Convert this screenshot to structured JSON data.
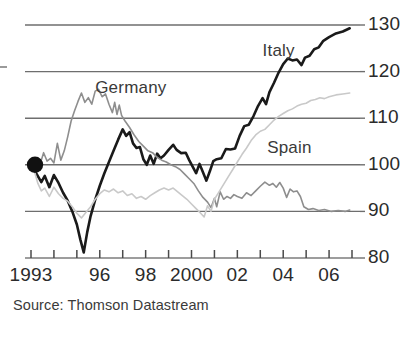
{
  "chart_data": {
    "type": "line",
    "title": "",
    "subtitle": "",
    "xlabel": "",
    "ylabel": "",
    "xlim": [
      1993,
      2007
    ],
    "ylim": [
      80,
      130
    ],
    "grid": true,
    "gridlines_y": [
      80,
      90,
      100,
      110,
      120,
      130
    ],
    "legend_position": "inline-annotations",
    "index_base_note": "Index, 1993 = 100",
    "y_tick_labels": [
      "130",
      "120",
      "110",
      "100",
      "90",
      "80"
    ],
    "y_ticks": [
      130,
      120,
      110,
      100,
      90,
      80
    ],
    "x_tick_years": [
      1993,
      1994,
      1995,
      1996,
      1997,
      1998,
      1999,
      2000,
      2001,
      2002,
      2003,
      2004,
      2005,
      2006,
      2007
    ],
    "x_tick_labels": [
      "1993",
      "",
      "",
      "96",
      "",
      "98",
      "",
      "2000",
      "",
      "02",
      "",
      "04",
      "",
      "06",
      ""
    ],
    "start_marker": {
      "x": 1993.0,
      "y": 100,
      "shape": "filled-circle",
      "color": "#111111"
    },
    "series": [
      {
        "name": "Italy",
        "color": "#1a1a1a",
        "width": 2.6,
        "label_position": {
          "x": 2003.1,
          "y": 124.5
        },
        "points": [
          [
            1993.0,
            100.0
          ],
          [
            1993.25,
            98.0
          ],
          [
            1993.45,
            96.3
          ],
          [
            1993.6,
            97.6
          ],
          [
            1993.8,
            95.2
          ],
          [
            1994.0,
            97.8
          ],
          [
            1994.2,
            96.1
          ],
          [
            1994.4,
            94.0
          ],
          [
            1994.6,
            92.3
          ],
          [
            1994.8,
            90.0
          ],
          [
            1995.0,
            87.2
          ],
          [
            1995.15,
            84.0
          ],
          [
            1995.3,
            81.2
          ],
          [
            1995.45,
            85.5
          ],
          [
            1995.6,
            89.0
          ],
          [
            1995.8,
            92.5
          ],
          [
            1996.0,
            95.5
          ],
          [
            1996.2,
            98.2
          ],
          [
            1996.4,
            100.6
          ],
          [
            1996.6,
            103.0
          ],
          [
            1996.8,
            105.4
          ],
          [
            1997.0,
            107.6
          ],
          [
            1997.15,
            106.2
          ],
          [
            1997.3,
            107.0
          ],
          [
            1997.45,
            104.6
          ],
          [
            1997.6,
            103.6
          ],
          [
            1997.75,
            103.8
          ],
          [
            1997.9,
            101.2
          ],
          [
            1998.05,
            100.0
          ],
          [
            1998.2,
            102.0
          ],
          [
            1998.35,
            100.2
          ],
          [
            1998.5,
            102.4
          ],
          [
            1998.65,
            101.4
          ],
          [
            1998.8,
            102.0
          ],
          [
            1999.0,
            103.2
          ],
          [
            1999.2,
            104.3
          ],
          [
            1999.35,
            103.2
          ],
          [
            1999.55,
            102.5
          ],
          [
            1999.75,
            102.6
          ],
          [
            1999.9,
            101.0
          ],
          [
            2000.05,
            99.6
          ],
          [
            2000.2,
            98.2
          ],
          [
            2000.35,
            100.2
          ],
          [
            2000.5,
            98.4
          ],
          [
            2000.65,
            96.6
          ],
          [
            2000.8,
            98.6
          ],
          [
            2000.95,
            100.8
          ],
          [
            2001.1,
            101.2
          ],
          [
            2001.3,
            101.4
          ],
          [
            2001.5,
            103.4
          ],
          [
            2001.7,
            103.3
          ],
          [
            2001.9,
            103.5
          ],
          [
            2002.1,
            106.2
          ],
          [
            2002.3,
            108.3
          ],
          [
            2002.5,
            108.6
          ],
          [
            2002.7,
            110.4
          ],
          [
            2002.9,
            112.6
          ],
          [
            2003.1,
            114.3
          ],
          [
            2003.25,
            113.0
          ],
          [
            2003.4,
            115.6
          ],
          [
            2003.6,
            117.6
          ],
          [
            2003.8,
            119.8
          ],
          [
            2004.0,
            121.6
          ],
          [
            2004.2,
            122.8
          ],
          [
            2004.4,
            122.4
          ],
          [
            2004.6,
            122.6
          ],
          [
            2004.8,
            121.4
          ],
          [
            2004.95,
            123.0
          ],
          [
            2005.15,
            123.4
          ],
          [
            2005.35,
            124.8
          ],
          [
            2005.55,
            125.2
          ],
          [
            2005.75,
            126.6
          ],
          [
            2006.0,
            127.4
          ],
          [
            2006.3,
            128.2
          ],
          [
            2006.6,
            128.6
          ],
          [
            2006.9,
            129.3
          ]
        ]
      },
      {
        "name": "Germany",
        "color": "#8e8e8e",
        "width": 1.6,
        "label_position": {
          "x": 1995.8,
          "y": 116.5
        },
        "points": [
          [
            1993.0,
            100.0
          ],
          [
            1993.2,
            101.4
          ],
          [
            1993.4,
            100.2
          ],
          [
            1993.55,
            102.6
          ],
          [
            1993.7,
            100.8
          ],
          [
            1993.85,
            101.4
          ],
          [
            1994.0,
            100.4
          ],
          [
            1994.15,
            104.6
          ],
          [
            1994.3,
            101.0
          ],
          [
            1994.45,
            103.0
          ],
          [
            1994.6,
            106.0
          ],
          [
            1994.75,
            109.4
          ],
          [
            1994.9,
            111.6
          ],
          [
            1995.05,
            113.6
          ],
          [
            1995.2,
            115.4
          ],
          [
            1995.35,
            113.4
          ],
          [
            1995.5,
            114.4
          ],
          [
            1995.65,
            113.0
          ],
          [
            1995.8,
            115.8
          ],
          [
            1995.95,
            116.2
          ],
          [
            1996.1,
            114.6
          ],
          [
            1996.25,
            115.2
          ],
          [
            1996.4,
            113.0
          ],
          [
            1996.55,
            111.2
          ],
          [
            1996.65,
            113.4
          ],
          [
            1996.75,
            110.8
          ],
          [
            1996.85,
            112.8
          ],
          [
            1996.95,
            110.6
          ],
          [
            1997.1,
            109.4
          ],
          [
            1997.3,
            108.0
          ],
          [
            1997.5,
            106.4
          ],
          [
            1997.7,
            105.0
          ],
          [
            1997.9,
            104.0
          ],
          [
            1998.1,
            103.0
          ],
          [
            1998.3,
            102.6
          ],
          [
            1998.5,
            101.6
          ],
          [
            1998.7,
            101.0
          ],
          [
            1998.9,
            100.6
          ],
          [
            1999.1,
            100.0
          ],
          [
            1999.3,
            99.6
          ],
          [
            1999.5,
            99.0
          ],
          [
            1999.7,
            98.0
          ],
          [
            1999.9,
            97.0
          ],
          [
            2000.1,
            96.0
          ],
          [
            2000.3,
            94.4
          ],
          [
            2000.5,
            93.0
          ],
          [
            2000.7,
            92.0
          ],
          [
            2000.85,
            90.8
          ],
          [
            2001.0,
            92.8
          ],
          [
            2001.1,
            91.0
          ],
          [
            2001.25,
            94.2
          ],
          [
            2001.4,
            92.6
          ],
          [
            2001.55,
            93.2
          ],
          [
            2001.7,
            92.8
          ],
          [
            2001.85,
            93.6
          ],
          [
            2002.0,
            93.2
          ],
          [
            2002.2,
            92.8
          ],
          [
            2002.4,
            94.0
          ],
          [
            2002.6,
            93.4
          ],
          [
            2002.8,
            94.4
          ],
          [
            2003.0,
            95.4
          ],
          [
            2003.2,
            96.3
          ],
          [
            2003.4,
            95.6
          ],
          [
            2003.55,
            96.0
          ],
          [
            2003.7,
            95.2
          ],
          [
            2003.85,
            96.2
          ],
          [
            2004.0,
            95.0
          ],
          [
            2004.15,
            93.0
          ],
          [
            2004.3,
            94.8
          ],
          [
            2004.45,
            94.2
          ],
          [
            2004.6,
            94.4
          ],
          [
            2004.75,
            93.2
          ],
          [
            2004.9,
            91.0
          ],
          [
            2005.1,
            90.4
          ],
          [
            2005.3,
            90.6
          ],
          [
            2005.55,
            90.2
          ],
          [
            2005.8,
            90.4
          ],
          [
            2006.1,
            90.0
          ],
          [
            2006.4,
            90.2
          ],
          [
            2006.7,
            90.0
          ],
          [
            2006.9,
            90.3
          ]
        ]
      },
      {
        "name": "Spain",
        "color": "#c9c9c9",
        "width": 1.6,
        "label_position": {
          "x": 2003.3,
          "y": 103.6
        },
        "points": [
          [
            1993.0,
            100.0
          ],
          [
            1993.15,
            98.6
          ],
          [
            1993.3,
            96.0
          ],
          [
            1993.45,
            94.4
          ],
          [
            1993.6,
            95.0
          ],
          [
            1993.8,
            93.2
          ],
          [
            1994.0,
            95.2
          ],
          [
            1994.2,
            93.8
          ],
          [
            1994.4,
            92.8
          ],
          [
            1994.6,
            92.2
          ],
          [
            1994.8,
            91.0
          ],
          [
            1995.0,
            89.6
          ],
          [
            1995.2,
            88.6
          ],
          [
            1995.4,
            89.8
          ],
          [
            1995.6,
            91.0
          ],
          [
            1995.8,
            92.6
          ],
          [
            1996.0,
            93.8
          ],
          [
            1996.2,
            94.6
          ],
          [
            1996.4,
            94.2
          ],
          [
            1996.6,
            94.8
          ],
          [
            1996.8,
            94.0
          ],
          [
            1997.0,
            94.4
          ],
          [
            1997.2,
            93.4
          ],
          [
            1997.4,
            93.8
          ],
          [
            1997.6,
            92.8
          ],
          [
            1997.8,
            93.2
          ],
          [
            1998.0,
            92.6
          ],
          [
            1998.2,
            93.4
          ],
          [
            1998.4,
            94.0
          ],
          [
            1998.6,
            94.6
          ],
          [
            1998.8,
            95.0
          ],
          [
            1999.0,
            94.6
          ],
          [
            1999.2,
            95.0
          ],
          [
            1999.4,
            94.2
          ],
          [
            1999.6,
            93.4
          ],
          [
            1999.8,
            92.6
          ],
          [
            2000.0,
            91.6
          ],
          [
            2000.2,
            90.6
          ],
          [
            2000.4,
            89.6
          ],
          [
            2000.55,
            88.8
          ],
          [
            2000.7,
            91.2
          ],
          [
            2000.85,
            90.0
          ],
          [
            2001.0,
            92.6
          ],
          [
            2001.2,
            94.2
          ],
          [
            2001.4,
            95.8
          ],
          [
            2001.6,
            97.4
          ],
          [
            2001.8,
            99.0
          ],
          [
            2002.0,
            100.6
          ],
          [
            2002.2,
            102.2
          ],
          [
            2002.4,
            103.6
          ],
          [
            2002.6,
            105.2
          ],
          [
            2002.8,
            106.4
          ],
          [
            2003.0,
            107.2
          ],
          [
            2003.2,
            107.6
          ],
          [
            2003.4,
            108.6
          ],
          [
            2003.6,
            109.6
          ],
          [
            2003.8,
            110.4
          ],
          [
            2004.0,
            111.0
          ],
          [
            2004.2,
            111.6
          ],
          [
            2004.4,
            112.0
          ],
          [
            2004.6,
            112.6
          ],
          [
            2004.8,
            113.0
          ],
          [
            2005.0,
            113.2
          ],
          [
            2005.2,
            113.8
          ],
          [
            2005.4,
            114.0
          ],
          [
            2005.6,
            114.4
          ],
          [
            2005.8,
            114.2
          ],
          [
            2006.0,
            114.6
          ],
          [
            2006.3,
            115.0
          ],
          [
            2006.6,
            115.2
          ],
          [
            2006.9,
            115.4
          ]
        ]
      }
    ]
  },
  "annotations": {
    "italy_label": "Italy",
    "germany_label": "Germany",
    "spain_label": "Spain"
  },
  "source": {
    "text": "Source: Thomson Datastream"
  }
}
